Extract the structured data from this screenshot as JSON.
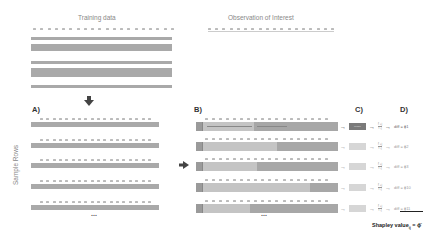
{
  "titles": {
    "training": "Training data",
    "observation": "Observation of Interest"
  },
  "labels": {
    "a": "A)",
    "b": "B)",
    "c": "C)",
    "d": "D)",
    "sample_rows": "Sample Rows",
    "ellipsis": "..."
  },
  "model_label": "Model",
  "fraction": {
    "numerator": "f̂ +j",
    "denominator": "f̂ -j"
  },
  "diffs": [
    "diff = ϕ1",
    "diff = ϕ2",
    "diff = ϕ3",
    "diff = ϕ10",
    "diff = ϕ11"
  ],
  "shapley": {
    "text": "Shapley value",
    "subscript": "ij",
    "formula": " = ϕ̄"
  },
  "colors": {
    "bar": "#a9a9a9",
    "light": "#c4c4c4",
    "model_dark": "#7a7a7a",
    "model_light": "#d6d6d6",
    "arrow": "#444444"
  },
  "rows": {
    "sample_count": 5,
    "split_positions": [
      0.36,
      0.52,
      0.38,
      0.75,
      0.33
    ]
  }
}
